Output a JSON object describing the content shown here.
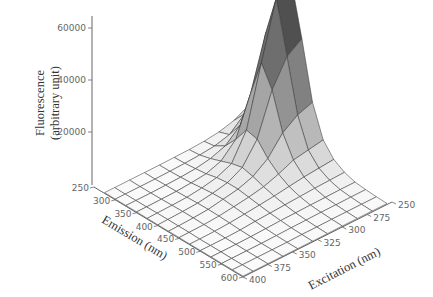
{
  "chart_data": {
    "type": "surface3d",
    "title": "",
    "zlabel": [
      "Fluorescence",
      "(arbitrary unit)"
    ],
    "xlabel": "Emission (nm)",
    "ylabel": "Excitation (nm)",
    "z_ticks": [
      {
        "value": 20000,
        "label": "20000"
      },
      {
        "value": 40000,
        "label": "40000"
      },
      {
        "value": 60000,
        "label": "60000"
      }
    ],
    "emission_ticks": [
      "250",
      "300",
      "350",
      "400",
      "450",
      "500",
      "550",
      "600"
    ],
    "excitation_ticks": [
      "250",
      "275",
      "300",
      "325",
      "350",
      "375",
      "400"
    ],
    "zlim": [
      0,
      65000
    ],
    "emission_range": [
      250,
      600
    ],
    "excitation_range": [
      250,
      400
    ],
    "grid": {
      "emission": [
        275,
        300,
        325,
        350,
        375,
        400,
        425,
        450,
        475,
        500,
        525,
        550,
        575,
        600
      ],
      "excitation": [
        255,
        270,
        285,
        300,
        315,
        330,
        345,
        360,
        375,
        390,
        400
      ],
      "intensity": [
        [
          6000,
          3000,
          1500,
          800,
          500,
          400,
          300,
          300,
          300,
          300,
          300
        ],
        [
          14000,
          8000,
          3000,
          1500,
          900,
          600,
          400,
          300,
          300,
          300,
          300
        ],
        [
          30000,
          22000,
          9000,
          4000,
          2000,
          1000,
          600,
          400,
          300,
          300,
          300
        ],
        [
          52000,
          44000,
          24000,
          9000,
          3500,
          1500,
          900,
          500,
          400,
          300,
          300
        ],
        [
          64000,
          60000,
          38000,
          15000,
          5000,
          2500,
          1400,
          700,
          500,
          400,
          300
        ],
        [
          44000,
          40000,
          30000,
          14000,
          6000,
          3000,
          1800,
          900,
          600,
          400,
          300
        ],
        [
          22000,
          20000,
          16000,
          9000,
          5000,
          3000,
          2000,
          1000,
          600,
          400,
          300
        ],
        [
          10000,
          9000,
          8000,
          5500,
          3500,
          2400,
          1600,
          900,
          500,
          400,
          300
        ],
        [
          5000,
          4500,
          4000,
          3200,
          2400,
          1800,
          1200,
          700,
          400,
          300,
          300
        ],
        [
          2500,
          2300,
          2100,
          1800,
          1500,
          1200,
          900,
          500,
          300,
          300,
          300
        ],
        [
          1200,
          1200,
          1100,
          1000,
          900,
          800,
          600,
          400,
          300,
          300,
          300
        ],
        [
          800,
          800,
          700,
          700,
          600,
          500,
          400,
          300,
          300,
          300,
          300
        ],
        [
          500,
          500,
          500,
          500,
          400,
          400,
          300,
          300,
          300,
          300,
          300
        ],
        [
          400,
          400,
          400,
          400,
          300,
          300,
          300,
          300,
          300,
          300,
          300
        ]
      ]
    },
    "peak": {
      "emission_nm": 375,
      "excitation_nm": 255,
      "max_intensity": 64000
    },
    "grid_lines": false,
    "legend": null
  }
}
